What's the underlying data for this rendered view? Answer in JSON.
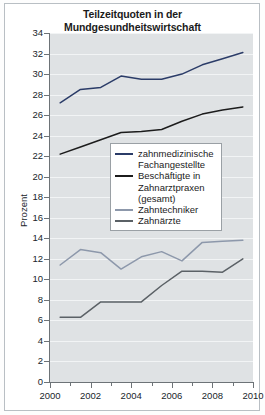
{
  "chart_data": {
    "type": "line",
    "title": "Teilzeitquoten in der Mundgesundheitswirtschaft",
    "title_lines": [
      "Teilzeitquoten in der",
      "Mundgesundheitswirtschaft"
    ],
    "xlabel": "",
    "ylabel": "Prozent",
    "xlim": [
      2000,
      2010
    ],
    "ylim": [
      0,
      34
    ],
    "ytick_step": 2,
    "xtick_step": 2,
    "x_minor_tick_step": 1,
    "grid": true,
    "grid_axis": "y",
    "legend_position": "center",
    "y_ticks": [
      0,
      2,
      4,
      6,
      8,
      10,
      12,
      14,
      16,
      18,
      20,
      22,
      24,
      26,
      28,
      30,
      32,
      34
    ],
    "x_ticks": [
      2000,
      2002,
      2004,
      2006,
      2008,
      2010
    ],
    "x_tick_labels": [
      "2000",
      "2002",
      "2004",
      "2006",
      "2008",
      "2010"
    ],
    "x": [
      2000.5,
      2001.5,
      2002.5,
      2003.5,
      2004.5,
      2005.5,
      2006.5,
      2007.5,
      2008.5,
      2009.5
    ],
    "series": [
      {
        "name": "zahnmedizinische Fachangestellte",
        "label_lines": [
          "zahnmedizinische",
          "Fachangestellte"
        ],
        "color": "#2b3c68",
        "values": [
          27.2,
          28.5,
          28.7,
          29.8,
          29.5,
          29.5,
          30.0,
          30.9,
          31.5,
          32.1
        ]
      },
      {
        "name": "Beschäftigte in Zahnarztpraxen (gesamt)",
        "label_lines": [
          "Beschäftigte in",
          "Zahnarztpraxen",
          "(gesamt)"
        ],
        "color": "#1c1c1c",
        "values": [
          22.2,
          22.9,
          23.6,
          24.3,
          24.4,
          24.6,
          25.4,
          26.1,
          26.5,
          26.8
        ]
      },
      {
        "name": "Zahntechniker",
        "label_lines": [
          "Zahntechniker"
        ],
        "color": "#8d98ab",
        "values": [
          11.4,
          12.9,
          12.6,
          11.0,
          12.2,
          12.7,
          11.8,
          13.6,
          13.7,
          13.8
        ]
      },
      {
        "name": "Zahnärzte",
        "label_lines": [
          "Zahnärzte"
        ],
        "color": "#5b6166",
        "values": [
          6.3,
          6.3,
          7.8,
          7.8,
          7.8,
          9.4,
          10.8,
          10.8,
          10.7,
          12.0
        ]
      }
    ]
  }
}
